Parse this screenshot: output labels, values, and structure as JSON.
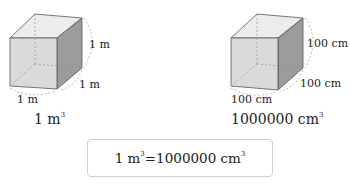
{
  "left_cube": {
    "height_label": "1 m",
    "depth_label": "1 m",
    "width_label": "1 m",
    "caption_base": "1 m",
    "caption_exp": "3"
  },
  "right_cube": {
    "height_label": "100 cm",
    "depth_label": "100 cm",
    "width_label": "100 cm",
    "caption_base": "1000000 cm",
    "caption_exp": "3"
  },
  "equation": {
    "lhs_base": "1 m",
    "lhs_exp": "3",
    "equals": "=",
    "rhs_base": "1000000 cm",
    "rhs_exp": "3"
  },
  "colors": {
    "front_face": "#d9d9d9",
    "top_face": "#ebebeb",
    "side_face": "#9a9a9a",
    "edge": "#555555",
    "dashed": "#888888"
  }
}
